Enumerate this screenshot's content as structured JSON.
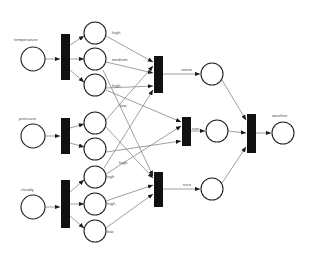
{
  "diagram": {
    "type": "petri-net",
    "colors": {
      "place_stroke": "#222222",
      "place_fill": "#ffffff",
      "transition_fill": "#111111",
      "arc": "#777777",
      "label_text": "#4a4a4a",
      "background": "#ffffff"
    },
    "places": [
      {
        "id": "temperature",
        "label": "temperature",
        "cx": 33,
        "cy": 59,
        "r": 12,
        "label_x": 14,
        "label_y": 38
      },
      {
        "id": "pressure",
        "label": "pressure",
        "cx": 33,
        "cy": 136,
        "r": 12,
        "label_x": 19,
        "label_y": 117
      },
      {
        "id": "cloudy",
        "label": "cloudy",
        "cx": 33,
        "cy": 207,
        "r": 12,
        "label_x": 21,
        "label_y": 188
      },
      {
        "id": "temp_high",
        "label": "high",
        "cx": 95,
        "cy": 33,
        "r": 11,
        "label_x": 112,
        "label_y": 31
      },
      {
        "id": "temp_medium",
        "label": "medium",
        "cx": 95,
        "cy": 59,
        "r": 11,
        "label_x": 112,
        "label_y": 58
      },
      {
        "id": "temp_low",
        "label": "high",
        "cx": 95,
        "cy": 85,
        "r": 11,
        "label_x": 112,
        "label_y": 84
      },
      {
        "id": "pres_high",
        "label": "low",
        "cx": 95,
        "cy": 123,
        "r": 11,
        "label_x": 120,
        "label_y": 104
      },
      {
        "id": "pres_low",
        "label": "high",
        "cx": 95,
        "cy": 149,
        "r": 11,
        "label_x": 119,
        "label_y": 161
      },
      {
        "id": "cloud_high",
        "label": "high",
        "cx": 95,
        "cy": 177,
        "r": 11,
        "label_x": 106,
        "label_y": 175
      },
      {
        "id": "cloud_med",
        "label": "high",
        "cx": 95,
        "cy": 204,
        "r": 11,
        "label_x": 107,
        "label_y": 202
      },
      {
        "id": "cloud_low",
        "label": "low",
        "cx": 95,
        "cy": 231,
        "r": 11,
        "label_x": 107,
        "label_y": 230
      },
      {
        "id": "storm",
        "label": "storm",
        "cx": 212,
        "cy": 74,
        "r": 11,
        "label_x": 181,
        "label_y": 68
      },
      {
        "id": "rain",
        "label": "rain",
        "cx": 217,
        "cy": 131,
        "r": 11,
        "label_x": 192,
        "label_y": 127
      },
      {
        "id": "nice",
        "label": "nice",
        "cx": 212,
        "cy": 189,
        "r": 11,
        "label_x": 183,
        "label_y": 183
      },
      {
        "id": "weather",
        "label": "weather",
        "cx": 283,
        "cy": 133,
        "r": 11,
        "label_x": 272,
        "label_y": 114
      }
    ],
    "transitions": [
      {
        "id": "t_temperature",
        "x": 61,
        "y": 34,
        "w": 9,
        "h": 46
      },
      {
        "id": "t_pressure",
        "x": 61,
        "y": 118,
        "w": 9,
        "h": 36
      },
      {
        "id": "t_cloudy",
        "x": 61,
        "y": 180,
        "w": 9,
        "h": 48
      },
      {
        "id": "t_storm",
        "x": 154,
        "y": 56,
        "w": 9,
        "h": 37
      },
      {
        "id": "t_rain",
        "x": 182,
        "y": 117,
        "w": 9,
        "h": 29
      },
      {
        "id": "t_nice",
        "x": 154,
        "y": 172,
        "w": 9,
        "h": 35
      },
      {
        "id": "t_weather",
        "x": 247,
        "y": 114,
        "w": 9,
        "h": 39
      }
    ],
    "arcs": [
      {
        "from": "temperature",
        "to": "t_temperature",
        "x1": 45,
        "y1": 59,
        "x2": 60,
        "y2": 59,
        "arrow": true
      },
      {
        "from": "pressure",
        "to": "t_pressure",
        "x1": 45,
        "y1": 136,
        "x2": 60,
        "y2": 136,
        "arrow": true
      },
      {
        "from": "cloudy",
        "to": "t_cloudy",
        "x1": 45,
        "y1": 207,
        "x2": 60,
        "y2": 207,
        "arrow": true
      },
      {
        "from": "t_temperature",
        "to": "temp_high",
        "x1": 70,
        "y1": 45,
        "x2": 84,
        "y2": 36,
        "arrow": true
      },
      {
        "from": "t_temperature",
        "to": "temp_medium",
        "x1": 70,
        "y1": 59,
        "x2": 84,
        "y2": 59,
        "arrow": true
      },
      {
        "from": "t_temperature",
        "to": "temp_low",
        "x1": 70,
        "y1": 70,
        "x2": 84,
        "y2": 82,
        "arrow": true
      },
      {
        "from": "t_pressure",
        "to": "pres_high",
        "x1": 70,
        "y1": 128,
        "x2": 84,
        "y2": 124,
        "arrow": true
      },
      {
        "from": "t_pressure",
        "to": "pres_low",
        "x1": 70,
        "y1": 143,
        "x2": 84,
        "y2": 147,
        "arrow": true
      },
      {
        "from": "t_cloudy",
        "to": "cloud_high",
        "x1": 70,
        "y1": 192,
        "x2": 84,
        "y2": 180,
        "arrow": true
      },
      {
        "from": "t_cloudy",
        "to": "cloud_med",
        "x1": 70,
        "y1": 204,
        "x2": 84,
        "y2": 204,
        "arrow": true
      },
      {
        "from": "t_cloudy",
        "to": "cloud_low",
        "x1": 70,
        "y1": 216,
        "x2": 84,
        "y2": 228,
        "arrow": true
      },
      {
        "from": "temp_high",
        "to": "t_storm",
        "x1": 106,
        "y1": 36,
        "x2": 153,
        "y2": 62,
        "arrow": true
      },
      {
        "from": "temp_medium",
        "to": "t_storm",
        "x1": 106,
        "y1": 62,
        "x2": 153,
        "y2": 73,
        "arrow": true
      },
      {
        "from": "temp_low",
        "to": "t_storm",
        "x1": 106,
        "y1": 88,
        "x2": 153,
        "y2": 86,
        "arrow": true
      },
      {
        "from": "pres_high",
        "to": "t_storm",
        "x1": 106,
        "y1": 120,
        "x2": 153,
        "y2": 66,
        "arrow": true
      },
      {
        "from": "temp_low",
        "to": "t_rain",
        "x1": 106,
        "y1": 90,
        "x2": 181,
        "y2": 122,
        "arrow": true
      },
      {
        "from": "pres_low",
        "to": "t_rain",
        "x1": 106,
        "y1": 152,
        "x2": 181,
        "y2": 141,
        "arrow": true
      },
      {
        "from": "cloud_high",
        "to": "t_rain",
        "x1": 106,
        "y1": 174,
        "x2": 181,
        "y2": 126,
        "arrow": true
      },
      {
        "from": "pres_high",
        "to": "t_nice",
        "x1": 106,
        "y1": 127,
        "x2": 153,
        "y2": 178,
        "arrow": true
      },
      {
        "from": "cloud_med",
        "to": "t_nice",
        "x1": 106,
        "y1": 201,
        "x2": 153,
        "y2": 185,
        "arrow": true
      },
      {
        "from": "cloud_low",
        "to": "t_nice",
        "x1": 106,
        "y1": 228,
        "x2": 153,
        "y2": 194,
        "arrow": true
      },
      {
        "from": "temp_medium",
        "to": "t_nice",
        "x1": 103,
        "y1": 70,
        "x2": 153,
        "y2": 176,
        "arrow": true
      },
      {
        "from": "cloud_high",
        "to": "t_storm",
        "x1": 104,
        "y1": 168,
        "x2": 153,
        "y2": 90,
        "arrow": true
      },
      {
        "from": "t_storm",
        "to": "storm",
        "x1": 163,
        "y1": 74,
        "x2": 200,
        "y2": 74,
        "arrow": true
      },
      {
        "from": "t_rain",
        "to": "rain",
        "x1": 191,
        "y1": 131,
        "x2": 205,
        "y2": 131,
        "arrow": true
      },
      {
        "from": "t_nice",
        "to": "nice",
        "x1": 163,
        "y1": 189,
        "x2": 200,
        "y2": 189,
        "arrow": true
      },
      {
        "from": "storm",
        "to": "t_weather",
        "x1": 222,
        "y1": 80,
        "x2": 246,
        "y2": 120,
        "arrow": true
      },
      {
        "from": "rain",
        "to": "t_weather",
        "x1": 228,
        "y1": 131,
        "x2": 246,
        "y2": 133,
        "arrow": true
      },
      {
        "from": "nice",
        "to": "t_weather",
        "x1": 222,
        "y1": 183,
        "x2": 246,
        "y2": 147,
        "arrow": true
      },
      {
        "from": "t_weather",
        "to": "weather",
        "x1": 256,
        "y1": 133,
        "x2": 271,
        "y2": 133,
        "arrow": true
      }
    ]
  }
}
